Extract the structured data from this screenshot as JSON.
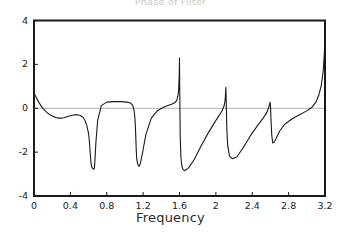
{
  "chart_data": {
    "type": "line",
    "title": "Phase of Filter",
    "xlabel": "Frequency",
    "ylabel": "",
    "xlim": [
      0,
      3.2
    ],
    "ylim": [
      -4,
      4
    ],
    "grid": false,
    "zero_line": true,
    "legend": null,
    "xticks": [
      "0",
      "0.4",
      "0.8",
      "1.2",
      "1.6",
      "2",
      "2.4",
      "2.8",
      "3.2"
    ],
    "xtick_values": [
      0,
      0.4,
      0.8,
      1.2,
      1.6,
      2.0,
      2.4,
      2.8,
      3.2
    ],
    "yticks": [
      "4",
      "2",
      "0",
      "-2",
      "-4"
    ],
    "ytick_values": [
      4,
      2,
      0,
      -2,
      -4
    ],
    "line_color": "#1a1a1a",
    "series": [
      {
        "name": "phase",
        "x": [
          0.0,
          0.03,
          0.06,
          0.09,
          0.12,
          0.15,
          0.18,
          0.21,
          0.24,
          0.27,
          0.3,
          0.33,
          0.36,
          0.39,
          0.42,
          0.45,
          0.48,
          0.51,
          0.54,
          0.56,
          0.58,
          0.6,
          0.61,
          0.615,
          0.62,
          0.625,
          0.63,
          0.64,
          0.655,
          0.66,
          0.665,
          0.67,
          0.68,
          0.7,
          0.74,
          0.8,
          0.88,
          0.96,
          1.02,
          1.06,
          1.085,
          1.1,
          1.11,
          1.115,
          1.12,
          1.125,
          1.13,
          1.14,
          1.155,
          1.16,
          1.17,
          1.19,
          1.23,
          1.29,
          1.36,
          1.43,
          1.48,
          1.52,
          1.55,
          1.57,
          1.585,
          1.592,
          1.597,
          1.6,
          1.603,
          1.608,
          1.615,
          1.625,
          1.64,
          1.66,
          1.7,
          1.76,
          1.84,
          1.92,
          1.99,
          2.04,
          2.07,
          2.09,
          2.1,
          2.105,
          2.11,
          2.115,
          2.12,
          2.13,
          2.15,
          2.18,
          2.23,
          2.3,
          2.38,
          2.46,
          2.52,
          2.56,
          2.58,
          2.59,
          2.597,
          2.602,
          2.607,
          2.615,
          2.625,
          2.64,
          2.66,
          2.7,
          2.76,
          2.84,
          2.92,
          3.0,
          3.06,
          3.1,
          3.13,
          3.16,
          3.18,
          3.19,
          3.195,
          3.2
        ],
        "y": [
          0.7,
          0.45,
          0.22,
          0.04,
          -0.11,
          -0.22,
          -0.31,
          -0.37,
          -0.42,
          -0.45,
          -0.45,
          -0.43,
          -0.39,
          -0.35,
          -0.32,
          -0.3,
          -0.3,
          -0.33,
          -0.42,
          -0.55,
          -0.78,
          -1.15,
          -1.55,
          -1.85,
          -2.15,
          -2.42,
          -2.6,
          -2.72,
          -2.78,
          -2.76,
          -2.68,
          -2.4,
          -1.6,
          -0.55,
          0.12,
          0.28,
          0.3,
          0.3,
          0.28,
          0.24,
          0.14,
          -0.1,
          -0.45,
          -0.85,
          -1.4,
          -1.95,
          -2.3,
          -2.55,
          -2.64,
          -2.62,
          -2.5,
          -2.1,
          -1.2,
          -0.45,
          -0.1,
          0.06,
          0.14,
          0.19,
          0.26,
          0.36,
          0.62,
          0.95,
          1.55,
          2.3,
          0.55,
          -1.3,
          -2.2,
          -2.62,
          -2.8,
          -2.84,
          -2.72,
          -2.35,
          -1.7,
          -1.1,
          -0.62,
          -0.3,
          -0.1,
          0.1,
          0.32,
          0.58,
          0.95,
          0.1,
          -0.9,
          -1.7,
          -2.18,
          -2.3,
          -2.22,
          -1.8,
          -1.25,
          -0.78,
          -0.45,
          -0.2,
          0.02,
          0.18,
          0.28,
          0.0,
          -0.6,
          -1.25,
          -1.58,
          -1.55,
          -1.4,
          -1.05,
          -0.72,
          -0.48,
          -0.3,
          -0.12,
          0.06,
          0.28,
          0.58,
          1.05,
          1.7,
          2.3,
          2.75,
          3.1
        ]
      }
    ]
  }
}
